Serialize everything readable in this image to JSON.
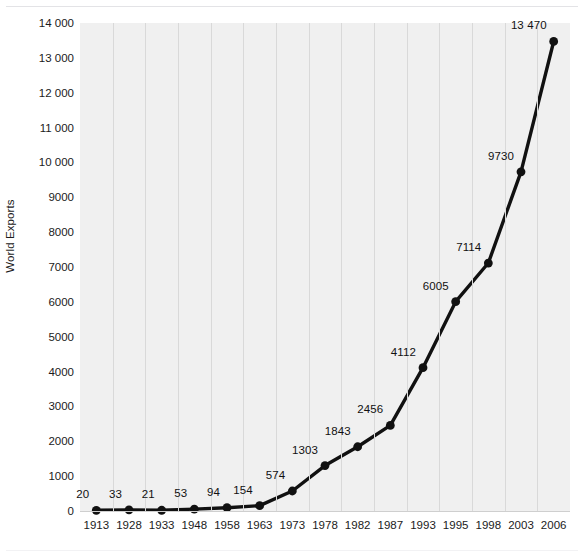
{
  "chart_data": {
    "type": "line",
    "title": "",
    "xlabel": "",
    "ylabel": "World Exports",
    "ylim": [
      0,
      14000
    ],
    "grid": "vertical",
    "legend": "none",
    "categories": [
      "1913",
      "1928",
      "1933",
      "1948",
      "1958",
      "1963",
      "1973",
      "1978",
      "1982",
      "1987",
      "1993",
      "1995",
      "1998",
      "2003",
      "2006"
    ],
    "values": [
      20,
      33,
      21,
      53,
      94,
      154,
      574,
      1303,
      1843,
      2456,
      4112,
      6005,
      7114,
      9730,
      13470
    ],
    "point_labels": [
      "20",
      "33",
      "21",
      "53",
      "94",
      "154",
      "574",
      "1303",
      "1843",
      "2456",
      "4112",
      "6005",
      "7114",
      "9730",
      "13 470"
    ],
    "ytick_values": [
      0,
      1000,
      2000,
      3000,
      4000,
      5000,
      6000,
      7000,
      8000,
      9000,
      10000,
      11000,
      12000,
      13000,
      14000
    ],
    "ytick_labels": [
      "0",
      "1000",
      "2000",
      "3000",
      "4000",
      "5000",
      "6000",
      "7000",
      "8000",
      "9000",
      "10 000",
      "11 000",
      "12 000",
      "13 000",
      "14 000"
    ],
    "series_color": "#111111",
    "plot_background": "#f0f0f0",
    "gridline_color": "#d9d9d9"
  }
}
